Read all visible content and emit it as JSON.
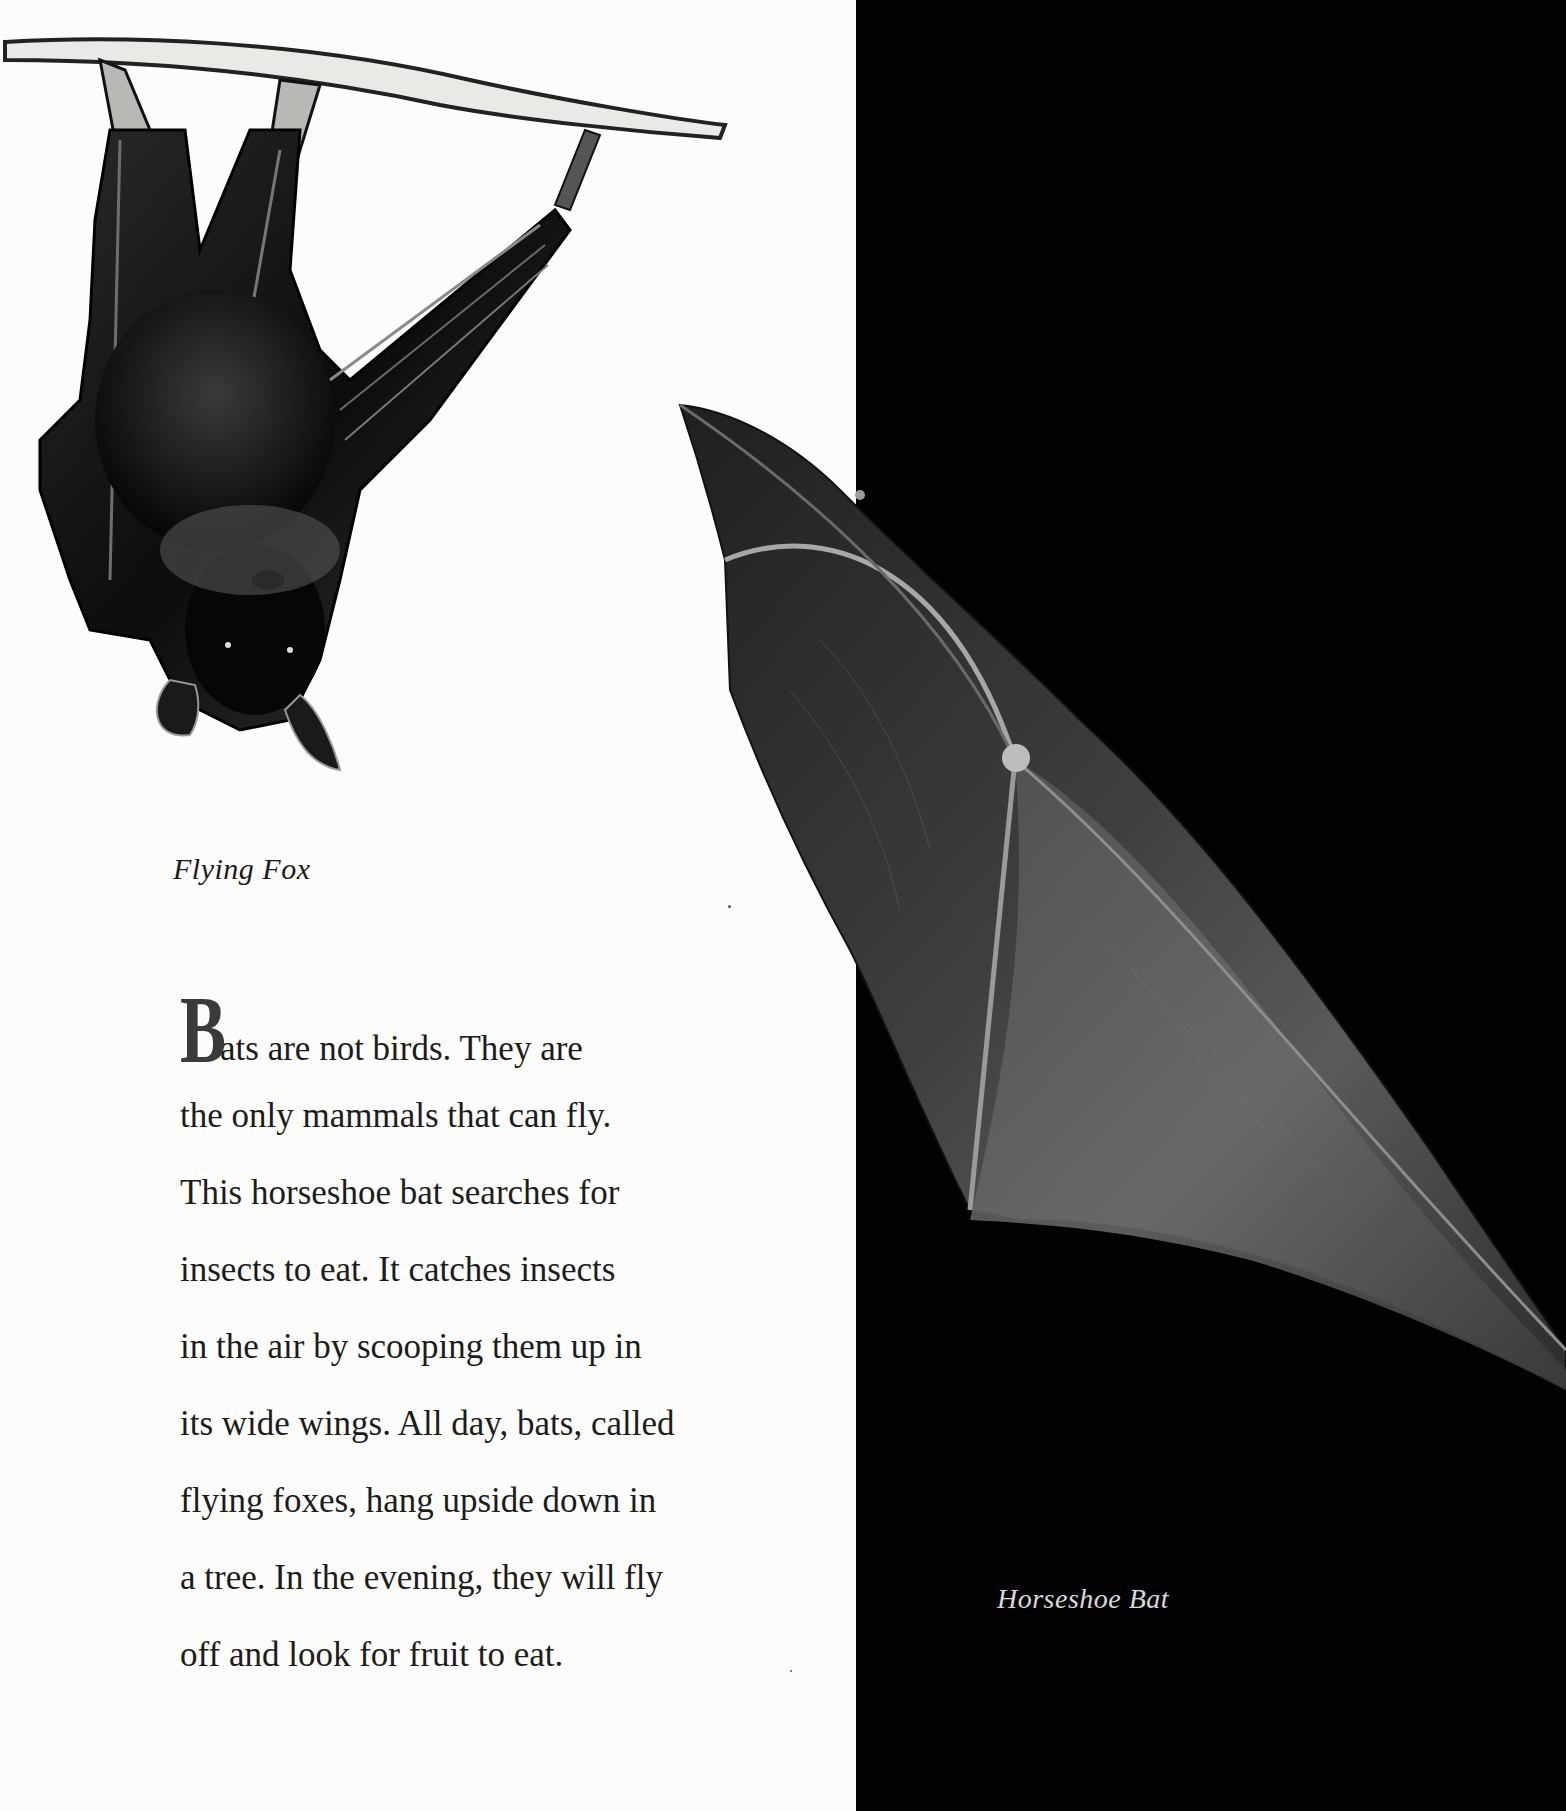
{
  "page": {
    "background_left": "#fcfcfb",
    "background_right": "#020202"
  },
  "photos": {
    "flying_fox": {
      "subject": "flying fox hanging upside down from branch",
      "tone": "black-and-white"
    },
    "horseshoe_bat": {
      "subject": "horseshoe bat wing in flight",
      "tone": "black-and-white"
    }
  },
  "captions": {
    "left": "Flying Fox",
    "right": "Horseshoe Bat"
  },
  "body": {
    "drop_cap": "B",
    "lines": [
      "ats are not birds. They are",
      "the only mammals that can fly.",
      "This horseshoe bat searches for",
      "insects to eat. It catches insects",
      "in the air by scooping them up in",
      "its wide wings. All day, bats, called",
      "flying foxes, hang upside down in",
      "a tree. In the evening, they will fly",
      "off and look for fruit to eat."
    ]
  }
}
